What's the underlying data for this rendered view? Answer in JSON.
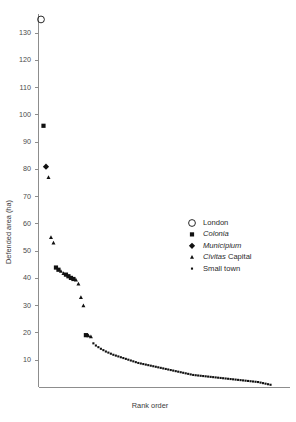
{
  "chart_data": {
    "type": "scatter",
    "title": "",
    "xlabel": "Rank order",
    "ylabel": "Defended area (ha)",
    "ylim": [
      0,
      137
    ],
    "xlim": [
      0,
      100
    ],
    "yticks": [
      10,
      20,
      30,
      40,
      50,
      60,
      70,
      80,
      90,
      100,
      110,
      120,
      130
    ],
    "xticks": [],
    "grid": false,
    "legend_position": "center-right",
    "legend": [
      {
        "key": "london",
        "label": "London",
        "marker": "open-circle"
      },
      {
        "key": "colonia",
        "label": "Colonia",
        "marker": "filled-square",
        "italic": true
      },
      {
        "key": "municipium",
        "label": "Municipium",
        "marker": "filled-diamond",
        "italic": true
      },
      {
        "key": "civitas",
        "label": "Civitas Capital",
        "marker": "filled-triangle",
        "italic_prefix": "Civitas"
      },
      {
        "key": "smalltown",
        "label": "Small town",
        "marker": "small-dot"
      }
    ],
    "series": [
      {
        "name": "London",
        "marker": "open-circle",
        "points": [
          {
            "rank": 1,
            "area": 135.0
          }
        ]
      },
      {
        "name": "Colonia",
        "marker": "filled-square",
        "points": [
          {
            "rank": 2,
            "area": 96.0
          },
          {
            "rank": 7,
            "area": 44.0
          },
          {
            "rank": 8,
            "area": 43.2
          },
          {
            "rank": 11,
            "area": 41.4
          },
          {
            "rank": 12,
            "area": 40.8
          },
          {
            "rank": 13,
            "area": 40.2
          },
          {
            "rank": 14,
            "area": 39.8
          },
          {
            "rank": 19,
            "area": 19.2
          }
        ]
      },
      {
        "name": "Municipium",
        "marker": "filled-diamond",
        "points": [
          {
            "rank": 3,
            "area": 81.0
          }
        ]
      },
      {
        "name": "Civitas Capital",
        "marker": "filled-triangle",
        "points": [
          {
            "rank": 4,
            "area": 77.0
          },
          {
            "rank": 5,
            "area": 55.0
          },
          {
            "rank": 6,
            "area": 53.0
          },
          {
            "rank": 9,
            "area": 42.6
          },
          {
            "rank": 10,
            "area": 41.8
          },
          {
            "rank": 15,
            "area": 39.4
          },
          {
            "rank": 16,
            "area": 38.0
          },
          {
            "rank": 17,
            "area": 33.0
          },
          {
            "rank": 18,
            "area": 30.0
          },
          {
            "rank": 20,
            "area": 19.0
          },
          {
            "rank": 21,
            "area": 18.6
          }
        ]
      },
      {
        "name": "Small town",
        "marker": "small-dot",
        "points": [
          {
            "rank": 22,
            "area": 16.2
          },
          {
            "rank": 23,
            "area": 15.4
          },
          {
            "rank": 24,
            "area": 14.8
          },
          {
            "rank": 25,
            "area": 14.2
          },
          {
            "rank": 26,
            "area": 13.7
          },
          {
            "rank": 27,
            "area": 13.2
          },
          {
            "rank": 28,
            "area": 12.8
          },
          {
            "rank": 29,
            "area": 12.4
          },
          {
            "rank": 30,
            "area": 12.0
          },
          {
            "rank": 31,
            "area": 11.7
          },
          {
            "rank": 32,
            "area": 11.4
          },
          {
            "rank": 33,
            "area": 11.1
          },
          {
            "rank": 34,
            "area": 10.8
          },
          {
            "rank": 35,
            "area": 10.5
          },
          {
            "rank": 36,
            "area": 10.2
          },
          {
            "rank": 37,
            "area": 9.9
          },
          {
            "rank": 38,
            "area": 9.6
          },
          {
            "rank": 39,
            "area": 9.3
          },
          {
            "rank": 40,
            "area": 9.0
          },
          {
            "rank": 41,
            "area": 8.8
          },
          {
            "rank": 42,
            "area": 8.6
          },
          {
            "rank": 43,
            "area": 8.4
          },
          {
            "rank": 44,
            "area": 8.2
          },
          {
            "rank": 45,
            "area": 8.0
          },
          {
            "rank": 46,
            "area": 7.8
          },
          {
            "rank": 47,
            "area": 7.6
          },
          {
            "rank": 48,
            "area": 7.4
          },
          {
            "rank": 49,
            "area": 7.2
          },
          {
            "rank": 50,
            "area": 7.0
          },
          {
            "rank": 51,
            "area": 6.8
          },
          {
            "rank": 52,
            "area": 6.6
          },
          {
            "rank": 53,
            "area": 6.4
          },
          {
            "rank": 54,
            "area": 6.2
          },
          {
            "rank": 55,
            "area": 6.0
          },
          {
            "rank": 56,
            "area": 5.8
          },
          {
            "rank": 57,
            "area": 5.6
          },
          {
            "rank": 58,
            "area": 5.4
          },
          {
            "rank": 59,
            "area": 5.2
          },
          {
            "rank": 60,
            "area": 5.0
          },
          {
            "rank": 61,
            "area": 4.8
          },
          {
            "rank": 62,
            "area": 4.6
          },
          {
            "rank": 63,
            "area": 4.5
          },
          {
            "rank": 64,
            "area": 4.4
          },
          {
            "rank": 65,
            "area": 4.3
          },
          {
            "rank": 66,
            "area": 4.2
          },
          {
            "rank": 67,
            "area": 4.1
          },
          {
            "rank": 68,
            "area": 4.0
          },
          {
            "rank": 69,
            "area": 3.9
          },
          {
            "rank": 70,
            "area": 3.8
          },
          {
            "rank": 71,
            "area": 3.7
          },
          {
            "rank": 72,
            "area": 3.6
          },
          {
            "rank": 73,
            "area": 3.5
          },
          {
            "rank": 74,
            "area": 3.4
          },
          {
            "rank": 75,
            "area": 3.3
          },
          {
            "rank": 76,
            "area": 3.2
          },
          {
            "rank": 77,
            "area": 3.1
          },
          {
            "rank": 78,
            "area": 3.0
          },
          {
            "rank": 79,
            "area": 2.9
          },
          {
            "rank": 80,
            "area": 2.8
          },
          {
            "rank": 81,
            "area": 2.7
          },
          {
            "rank": 82,
            "area": 2.6
          },
          {
            "rank": 83,
            "area": 2.5
          },
          {
            "rank": 84,
            "area": 2.4
          },
          {
            "rank": 85,
            "area": 2.3
          },
          {
            "rank": 86,
            "area": 2.2
          },
          {
            "rank": 87,
            "area": 2.1
          },
          {
            "rank": 88,
            "area": 2.0
          },
          {
            "rank": 89,
            "area": 1.8
          },
          {
            "rank": 90,
            "area": 1.6
          },
          {
            "rank": 91,
            "area": 1.4
          },
          {
            "rank": 92,
            "area": 1.2
          },
          {
            "rank": 93,
            "area": 1.0
          }
        ]
      }
    ]
  }
}
